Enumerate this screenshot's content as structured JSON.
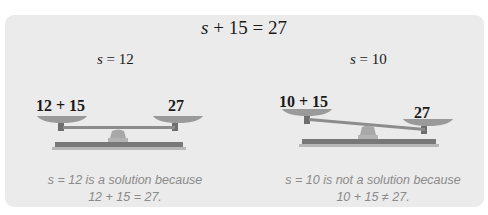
{
  "equation": {
    "variable": "s",
    "rest": " + 15 = 27"
  },
  "left": {
    "header_var": "s",
    "header_rest": " = 12",
    "left_pan_label": "12 + 15",
    "right_pan_label": "27",
    "balanced": true,
    "caption_line1": "s = 12 is a solution because",
    "caption_line2": "12 + 15 = 27."
  },
  "right": {
    "header_var": "s",
    "header_rest": " = 10",
    "left_pan_label": "10 + 15",
    "right_pan_label": "27",
    "balanced": false,
    "caption_line1": "s = 10 is not a solution because",
    "caption_line2": "10 + 15 ≠ 27."
  },
  "colors": {
    "panel_bg": "#ebebeb",
    "scale_dark": "#7d7d7d",
    "scale_mid": "#9a9a9a",
    "scale_light": "#b8b8b8",
    "caption": "#8a8a8a"
  }
}
